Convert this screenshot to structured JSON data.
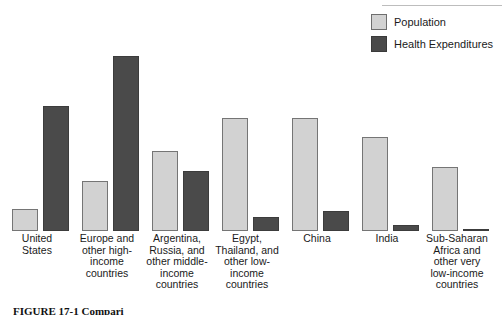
{
  "figure": {
    "caption_visible_fragment": "FIGURE 17-1  Compari",
    "legend": {
      "items": [
        {
          "label": "Population",
          "color": "#d2d2d2",
          "swatch_name": "legend-swatch-population"
        },
        {
          "label": "Health Expenditures",
          "color": "#4a4a4a",
          "swatch_name": "legend-swatch-health-expenditures"
        }
      ]
    }
  },
  "chart_data": {
    "type": "bar",
    "title": "",
    "subtitle": "",
    "xlabel": "",
    "ylabel": "",
    "ylim": [
      0,
      100
    ],
    "grid": false,
    "legend_position": "top-right",
    "units": "percent of world total (relative share)",
    "categories": [
      "United States",
      "Europe and other high-income countries",
      "Argentina, Russia, and other middle-income countries",
      "Egypt, Thailand, and other low-income countries",
      "China",
      "India",
      "Sub-Saharan Africa and other very low-income countries"
    ],
    "category_label_lines": [
      [
        "United",
        "States"
      ],
      [
        "Europe and",
        "other high-",
        "income",
        "countries"
      ],
      [
        "Argentina,",
        "Russia, and",
        "other middle-",
        "income",
        "countries"
      ],
      [
        "Egypt,",
        "Thailand, and",
        "other low-",
        "income",
        "countries"
      ],
      [
        "China"
      ],
      [
        "India"
      ],
      [
        "Sub-Saharan",
        "Africa and",
        "other very",
        "low-income",
        "countries"
      ]
    ],
    "series": [
      {
        "name": "Population",
        "color": "#d2d2d2",
        "values": [
          11,
          25,
          40,
          56,
          56,
          47,
          32
        ]
      },
      {
        "name": "Health Expenditures",
        "color": "#4a4a4a",
        "values": [
          62,
          87,
          30,
          7,
          10,
          3,
          1
        ]
      }
    ]
  }
}
